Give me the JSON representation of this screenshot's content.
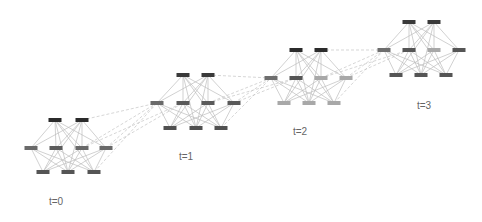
{
  "diagram": {
    "type": "temporal-network",
    "node_size": {
      "w": 13,
      "h": 4
    },
    "colors": {
      "edge": "#bdbdbd",
      "dashed_edge": "#c4c4c4",
      "label": "#666666",
      "dark_node": "#2b2b2b",
      "mid_node": "#555555",
      "gray_node": "#777777",
      "light_node": "#a8a8a8"
    },
    "snapshots": [
      {
        "label": "t=0",
        "label_pos": [
          56,
          205
        ],
        "nodes": [
          {
            "id": "a",
            "x": 55,
            "y": 120,
            "color": "#2b2b2b"
          },
          {
            "id": "b",
            "x": 82,
            "y": 120,
            "color": "#2b2b2b"
          },
          {
            "id": "c",
            "x": 31,
            "y": 148,
            "color": "#6a6a6a"
          },
          {
            "id": "d",
            "x": 56,
            "y": 148,
            "color": "#5c5c5c"
          },
          {
            "id": "e",
            "x": 82,
            "y": 148,
            "color": "#6a6a6a"
          },
          {
            "id": "f",
            "x": 106,
            "y": 148,
            "color": "#6a6a6a"
          },
          {
            "id": "g",
            "x": 43,
            "y": 172,
            "color": "#555555"
          },
          {
            "id": "h",
            "x": 68,
            "y": 172,
            "color": "#555555"
          },
          {
            "id": "i",
            "x": 94,
            "y": 172,
            "color": "#555555"
          }
        ]
      },
      {
        "label": "t=1",
        "label_pos": [
          186,
          160
        ],
        "nodes": [
          {
            "id": "a",
            "x": 183,
            "y": 75,
            "color": "#3a3a3a"
          },
          {
            "id": "b",
            "x": 208,
            "y": 75,
            "color": "#3a3a3a"
          },
          {
            "id": "c",
            "x": 157,
            "y": 103,
            "color": "#6a6a6a"
          },
          {
            "id": "d",
            "x": 183,
            "y": 103,
            "color": "#5a5a5a"
          },
          {
            "id": "e",
            "x": 208,
            "y": 103,
            "color": "#5a5a5a"
          },
          {
            "id": "f",
            "x": 234,
            "y": 103,
            "color": "#5a5a5a"
          },
          {
            "id": "g",
            "x": 170,
            "y": 128,
            "color": "#505050"
          },
          {
            "id": "h",
            "x": 196,
            "y": 128,
            "color": "#505050"
          },
          {
            "id": "i",
            "x": 221,
            "y": 128,
            "color": "#505050"
          }
        ]
      },
      {
        "label": "t=2",
        "label_pos": [
          300,
          135
        ],
        "nodes": [
          {
            "id": "a",
            "x": 296,
            "y": 50,
            "color": "#2b2b2b"
          },
          {
            "id": "b",
            "x": 321,
            "y": 50,
            "color": "#2b2b2b"
          },
          {
            "id": "c",
            "x": 271,
            "y": 78,
            "color": "#6e6e6e"
          },
          {
            "id": "d",
            "x": 296,
            "y": 78,
            "color": "#555555"
          },
          {
            "id": "e",
            "x": 321,
            "y": 78,
            "color": "#a8a8a8"
          },
          {
            "id": "f",
            "x": 346,
            "y": 78,
            "color": "#a8a8a8"
          },
          {
            "id": "g",
            "x": 284,
            "y": 103,
            "color": "#a8a8a8"
          },
          {
            "id": "h",
            "x": 309,
            "y": 103,
            "color": "#a8a8a8"
          },
          {
            "id": "i",
            "x": 334,
            "y": 103,
            "color": "#a8a8a8"
          }
        ]
      },
      {
        "label": "t=3",
        "label_pos": [
          424,
          109
        ],
        "nodes": [
          {
            "id": "a",
            "x": 409,
            "y": 22,
            "color": "#3a3a3a"
          },
          {
            "id": "b",
            "x": 434,
            "y": 22,
            "color": "#3a3a3a"
          },
          {
            "id": "c",
            "x": 384,
            "y": 50,
            "color": "#6e6e6e"
          },
          {
            "id": "d",
            "x": 409,
            "y": 50,
            "color": "#555555"
          },
          {
            "id": "e",
            "x": 434,
            "y": 50,
            "color": "#a8a8a8"
          },
          {
            "id": "f",
            "x": 459,
            "y": 50,
            "color": "#555555"
          },
          {
            "id": "g",
            "x": 396,
            "y": 75,
            "color": "#555555"
          },
          {
            "id": "h",
            "x": 421,
            "y": 75,
            "color": "#555555"
          },
          {
            "id": "i",
            "x": 446,
            "y": 75,
            "color": "#555555"
          }
        ]
      }
    ],
    "intra_edges": [
      [
        "a",
        "c"
      ],
      [
        "a",
        "d"
      ],
      [
        "a",
        "e"
      ],
      [
        "a",
        "f"
      ],
      [
        "a",
        "h"
      ],
      [
        "a",
        "i"
      ],
      [
        "b",
        "c"
      ],
      [
        "b",
        "d"
      ],
      [
        "b",
        "e"
      ],
      [
        "b",
        "f"
      ],
      [
        "b",
        "g"
      ],
      [
        "b",
        "h"
      ],
      [
        "c",
        "g"
      ],
      [
        "c",
        "h"
      ],
      [
        "c",
        "i"
      ],
      [
        "d",
        "g"
      ],
      [
        "d",
        "h"
      ],
      [
        "d",
        "i"
      ],
      [
        "e",
        "g"
      ],
      [
        "e",
        "h"
      ],
      [
        "e",
        "i"
      ],
      [
        "f",
        "g"
      ],
      [
        "f",
        "h"
      ],
      [
        "f",
        "i"
      ]
    ],
    "inter_edges": [
      [
        "e",
        "c"
      ],
      [
        "f",
        "c"
      ],
      [
        "f",
        "d"
      ],
      [
        "e",
        "d"
      ],
      [
        "b",
        "c"
      ],
      [
        "i",
        "c"
      ]
    ]
  }
}
